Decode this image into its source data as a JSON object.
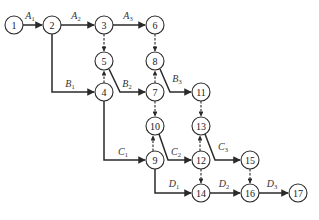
{
  "diagram": {
    "type": "activity-on-arrow network",
    "node_radius": 9,
    "colors": {
      "line": "#2a2a2a",
      "text": "#1a1a1a",
      "background": "#ffffff"
    },
    "nodes": [
      {
        "id": "1",
        "label": "1",
        "x": 14,
        "y": 25
      },
      {
        "id": "2",
        "label": "2",
        "x": 52,
        "y": 25
      },
      {
        "id": "3",
        "label": "3",
        "x": 104,
        "y": 25
      },
      {
        "id": "6",
        "label": "6",
        "x": 155,
        "y": 25
      },
      {
        "id": "5",
        "label": "5",
        "x": 104,
        "y": 61
      },
      {
        "id": "8",
        "label": "8",
        "x": 155,
        "y": 61
      },
      {
        "id": "4",
        "label": "4",
        "x": 104,
        "y": 92
      },
      {
        "id": "7",
        "label": "7",
        "x": 155,
        "y": 92
      },
      {
        "id": "11",
        "label": "11",
        "x": 201,
        "y": 92
      },
      {
        "id": "10",
        "label": "10",
        "x": 155,
        "y": 126
      },
      {
        "id": "13",
        "label": "13",
        "x": 201,
        "y": 126
      },
      {
        "id": "9",
        "label": "9",
        "x": 155,
        "y": 160
      },
      {
        "id": "12",
        "label": "12",
        "x": 201,
        "y": 160
      },
      {
        "id": "15",
        "label": "15",
        "x": 250,
        "y": 160
      },
      {
        "id": "14",
        "label": "14",
        "x": 201,
        "y": 193
      },
      {
        "id": "16",
        "label": "16",
        "x": 250,
        "y": 193
      },
      {
        "id": "17",
        "label": "17",
        "x": 298,
        "y": 193
      }
    ],
    "activities": [
      {
        "from": "1",
        "to": "2",
        "label": "A",
        "sub": "1"
      },
      {
        "from": "2",
        "to": "3",
        "label": "A",
        "sub": "2"
      },
      {
        "from": "3",
        "to": "6",
        "label": "A",
        "sub": "3"
      },
      {
        "from": "2",
        "to": "4",
        "label": "B",
        "sub": "1"
      },
      {
        "from": "5",
        "to": "7",
        "label": "B",
        "sub": "2"
      },
      {
        "from": "8",
        "to": "11",
        "label": "B",
        "sub": "3"
      },
      {
        "from": "4",
        "to": "9",
        "label": "C",
        "sub": "1"
      },
      {
        "from": "10",
        "to": "12",
        "label": "C",
        "sub": "2"
      },
      {
        "from": "13",
        "to": "15",
        "label": "C",
        "sub": "3"
      },
      {
        "from": "9",
        "to": "14",
        "label": "D",
        "sub": "1"
      },
      {
        "from": "14",
        "to": "16",
        "label": "D",
        "sub": "2"
      },
      {
        "from": "16",
        "to": "17",
        "label": "D",
        "sub": "3"
      }
    ],
    "dummy_activities": [
      {
        "from": "3",
        "to": "5"
      },
      {
        "from": "6",
        "to": "8"
      },
      {
        "from": "4",
        "to": "5"
      },
      {
        "from": "7",
        "to": "8"
      },
      {
        "from": "7",
        "to": "10"
      },
      {
        "from": "11",
        "to": "13"
      },
      {
        "from": "9",
        "to": "10"
      },
      {
        "from": "12",
        "to": "13"
      },
      {
        "from": "12",
        "to": "14"
      },
      {
        "from": "15",
        "to": "16"
      }
    ]
  }
}
